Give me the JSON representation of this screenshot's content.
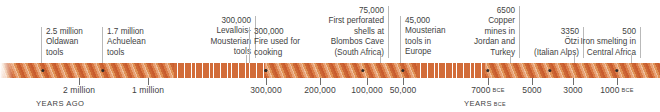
{
  "figure": {
    "type": "timeline",
    "title": "",
    "bar_color_dark": "#c85c2e",
    "bar_color_light": "#efbf9b",
    "dot_color": "#2f2a28",
    "rule_color": "#b9b9b9"
  },
  "axes": [
    {
      "caption": "YEARS AGO",
      "caption_suffix": "",
      "caption_x": 36,
      "ticks": [
        {
          "label": "2 million",
          "suffix": "",
          "x": 79
        },
        {
          "label": "1 million",
          "suffix": "",
          "x": 148
        }
      ]
    },
    {
      "caption": "",
      "caption_suffix": "",
      "caption_x": 0,
      "ticks": [
        {
          "label": "300,000",
          "suffix": "",
          "x": 266
        },
        {
          "label": "200,000",
          "suffix": "",
          "x": 320
        },
        {
          "label": "100,000",
          "suffix": "",
          "x": 367
        },
        {
          "label": "50,000",
          "suffix": "",
          "x": 403
        }
      ]
    },
    {
      "caption": "YEARS",
      "caption_suffix": "BCE",
      "caption_x": 464,
      "ticks": [
        {
          "label": "7000",
          "suffix": "BCE",
          "x": 488
        },
        {
          "label": "5000",
          "suffix": "",
          "x": 532
        },
        {
          "label": "3000",
          "suffix": "",
          "x": 573
        },
        {
          "label": "1000",
          "suffix": "BCE",
          "x": 617
        }
      ]
    }
  ],
  "bar_segments": [
    {
      "name": "segment-early-stone-age",
      "x": 0,
      "width": 174,
      "fade_left": true
    },
    {
      "name": "segment-mid-lower-paleolithic",
      "x": 265,
      "width": 152,
      "fade_left": false
    },
    {
      "name": "segment-holocene",
      "x": 485,
      "width": 175,
      "fade_left": false
    }
  ],
  "bar_breaks": [
    {
      "name": "time-break-one",
      "x": 174,
      "width": 91
    },
    {
      "name": "time-break-two",
      "x": 417,
      "width": 68
    }
  ],
  "events": [
    {
      "name": "oldowan-tools",
      "text": "2.5 million\nOldawan\ntools",
      "align": "left",
      "label_x": 41,
      "label_y": 27,
      "label_width": 60,
      "dot_x": 43,
      "dot_y": 69,
      "stem_x": 41,
      "stem_top": 55,
      "stem_height": 8
    },
    {
      "name": "acheulean-tools",
      "text": "1.7 million\nAchuelean\ntools",
      "align": "left",
      "label_x": 102,
      "label_y": 27,
      "label_width": 60,
      "dot_x": 103,
      "dot_y": 69,
      "stem_x": 102,
      "stem_top": 55,
      "stem_height": 8
    },
    {
      "name": "levallois-mousterian-tools",
      "text": "300,000\nLevallois-\nMousterian\ntools",
      "align": "right",
      "label_x": 186,
      "label_y": 16,
      "label_width": 61,
      "dot_x": 266,
      "dot_y": 69,
      "stem_x": 246,
      "stem_top": 55,
      "stem_height": 8
    },
    {
      "name": "fire-used-for-cooking",
      "text": "300,000\nFire used for\ncooking",
      "align": "left",
      "label_x": 249,
      "label_y": 27,
      "label_width": 62,
      "dot_x": 266,
      "dot_y": 69,
      "stem_x": 249,
      "stem_top": 55,
      "stem_height": 8
    },
    {
      "name": "blombos-cave-shells",
      "text": "75,000\nFirst perforated\nshells at\nBlombos Cave\n(South Africa)",
      "align": "right",
      "label_x": 306,
      "label_y": 6,
      "label_width": 74,
      "dot_x": 363,
      "dot_y": 69,
      "stem_x": 380,
      "stem_top": 55,
      "stem_height": 8
    },
    {
      "name": "mousterian-tools-in-europe",
      "text": "45,000\nMousterian\ntools in\nEurope",
      "align": "left",
      "label_x": 400,
      "label_y": 16,
      "label_width": 57,
      "dot_x": 403,
      "dot_y": 69,
      "stem_x": 400,
      "stem_top": 55,
      "stem_height": 8
    },
    {
      "name": "copper-mines-jordan-turkey",
      "text": "6500\nCopper\nmines in\nJordan and\nTurkey",
      "align": "right",
      "label_x": 455,
      "label_y": 6,
      "label_width": 56,
      "dot_x": 488,
      "dot_y": 69,
      "stem_x": 510,
      "stem_top": 55,
      "stem_height": 8
    },
    {
      "name": "otzi-italian-alps",
      "text": "3350\nÖtzi\n(Italian Alps)",
      "align": "right",
      "label_x": 512,
      "label_y": 27,
      "label_width": 63,
      "dot_x": 550,
      "dot_y": 69,
      "stem_x": 574,
      "stem_top": 55,
      "stem_height": 8
    },
    {
      "name": "iron-smelting-central-africa",
      "text": "500\nIron smelting in\nCentral Africa",
      "align": "right",
      "label_x": 557,
      "label_y": 27,
      "label_width": 75,
      "dot_x": 617,
      "dot_y": 69,
      "stem_x": 631,
      "stem_top": 55,
      "stem_height": 8
    }
  ]
}
